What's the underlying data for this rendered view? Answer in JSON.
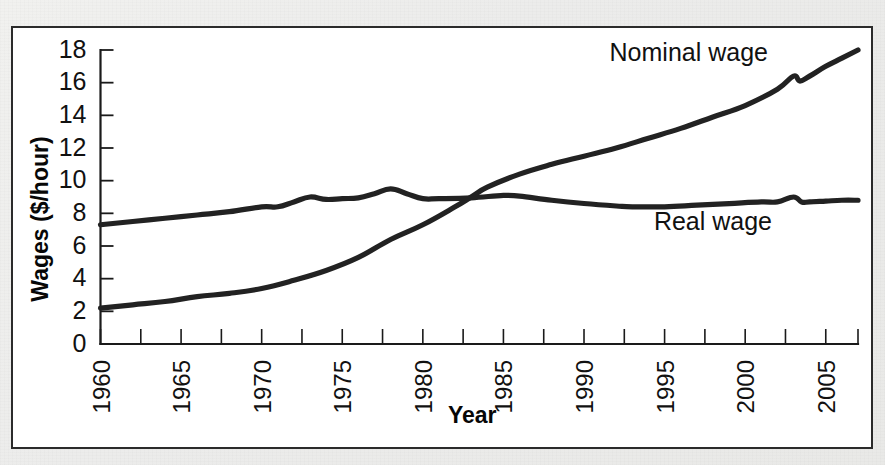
{
  "figure": {
    "background_color": "#eeeeec",
    "panel_color": "#ffffff",
    "border_color": "#2b2b2b",
    "ink_color": "#222222"
  },
  "chart_data": {
    "type": "line",
    "title": "",
    "subtitle": "",
    "xlabel": "Year",
    "ylabel": "Wages ($/hour)",
    "xlim": [
      1960,
      2007
    ],
    "ylim": [
      0,
      18
    ],
    "grid": false,
    "legend_position": "inline-annotation",
    "y_ticks": [
      0,
      2,
      4,
      6,
      8,
      10,
      12,
      14,
      16,
      18
    ],
    "y_tick_labels": [
      "0",
      "2",
      "4",
      "6",
      "8",
      "10",
      "12",
      "14",
      "16",
      "18"
    ],
    "x_ticks": [
      1960,
      1965,
      1970,
      1975,
      1980,
      1985,
      1990,
      1995,
      2000,
      2005
    ],
    "x_tick_labels": [
      "1960",
      "1965",
      "1970",
      "1975",
      "1980",
      "1985",
      "1990",
      "1995",
      "2000",
      "2005"
    ],
    "x_minor_tick_interval": 2.5,
    "x_tick_label_rotation": -90,
    "series": [
      {
        "name": "Nominal wage",
        "label": "Nominal wage",
        "color": "#222222",
        "label_x": 1996.5,
        "label_y": 17.3,
        "x": [
          1960,
          1962,
          1964,
          1966,
          1968,
          1970,
          1972,
          1974,
          1976,
          1978,
          1980,
          1982,
          1983,
          1984,
          1986,
          1988,
          1990,
          1992,
          1994,
          1996,
          1998,
          2000,
          2002,
          2003,
          2003.4,
          2004,
          2005,
          2006,
          2007
        ],
        "y": [
          2.2,
          2.4,
          2.6,
          2.9,
          3.1,
          3.4,
          3.9,
          4.5,
          5.3,
          6.4,
          7.3,
          8.4,
          9.0,
          9.6,
          10.4,
          11.0,
          11.5,
          12.0,
          12.6,
          13.2,
          13.9,
          14.6,
          15.6,
          16.4,
          16.1,
          16.4,
          17.0,
          17.5,
          18.0
        ]
      },
      {
        "name": "Real wage",
        "label": "Real wage",
        "color": "#222222",
        "label_x": 1998.0,
        "label_y": 7.0,
        "x": [
          1960,
          1962,
          1964,
          1966,
          1968,
          1970,
          1971,
          1972,
          1973,
          1974,
          1975,
          1976,
          1977,
          1978,
          1979,
          1980,
          1981,
          1983,
          1985,
          1986,
          1988,
          1990,
          1992,
          1993,
          1995,
          1997,
          1999,
          2001,
          2002,
          2003,
          2003.5,
          2004,
          2005,
          2006,
          2007
        ],
        "y": [
          7.3,
          7.5,
          7.7,
          7.9,
          8.1,
          8.4,
          8.4,
          8.7,
          9.0,
          8.85,
          8.9,
          8.95,
          9.2,
          9.5,
          9.2,
          8.9,
          8.9,
          8.95,
          9.1,
          9.05,
          8.8,
          8.6,
          8.45,
          8.4,
          8.4,
          8.5,
          8.6,
          8.7,
          8.7,
          9.0,
          8.7,
          8.7,
          8.75,
          8.8,
          8.8
        ]
      }
    ],
    "annotations": [
      {
        "text": "Nominal wage",
        "kind": "series-label"
      },
      {
        "text": "Real wage",
        "kind": "series-label"
      }
    ]
  }
}
